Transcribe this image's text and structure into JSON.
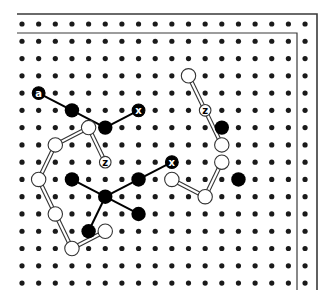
{
  "diagram": {
    "colors": {
      "background": "#ffffff",
      "dot": "#1a1a1a",
      "black_node": "#000000",
      "white_node_fill": "#ffffff",
      "outline": "#333333",
      "border": "#3a3a3a"
    },
    "grid": {
      "cols": 18,
      "rows": 16,
      "origin_x": 22,
      "origin_y": 24,
      "step_x": 16.65,
      "step_y": 17.27,
      "dot_radius": 2.6
    },
    "borders": {
      "outer": {
        "x1": 17,
        "y_top": 14,
        "x_right": 317,
        "y_bottom": 290
      },
      "inner": {
        "x1": 17,
        "y_top": 33,
        "x_right": 297,
        "y_bottom": 290
      }
    },
    "black_nodes": [
      {
        "c": 3,
        "r": 5
      },
      {
        "c": 5,
        "r": 6
      },
      {
        "c": 3,
        "r": 9
      },
      {
        "c": 5,
        "r": 10
      },
      {
        "c": 7,
        "r": 9
      },
      {
        "c": 7,
        "r": 11
      },
      {
        "c": 4,
        "r": 12
      },
      {
        "c": 12,
        "r": 6
      },
      {
        "c": 13,
        "r": 9
      }
    ],
    "white_nodes": [
      {
        "c": 4,
        "r": 6
      },
      {
        "c": 2,
        "r": 7
      },
      {
        "c": 1,
        "r": 9
      },
      {
        "c": 2,
        "r": 11
      },
      {
        "c": 3,
        "r": 13
      },
      {
        "c": 5,
        "r": 12
      },
      {
        "c": 10,
        "r": 3
      },
      {
        "c": 12,
        "r": 7
      },
      {
        "c": 12,
        "r": 8
      },
      {
        "c": 11,
        "r": 10
      },
      {
        "c": 9,
        "r": 9
      }
    ],
    "labeled_nodes": [
      {
        "c": 1,
        "r": 4,
        "label": "a",
        "style": "black"
      },
      {
        "c": 7,
        "r": 5,
        "label": "x",
        "style": "black"
      },
      {
        "c": 9,
        "r": 8,
        "label": "x",
        "style": "black"
      },
      {
        "c": 5,
        "r": 8,
        "label": "z",
        "style": "white"
      },
      {
        "c": 11,
        "r": 5,
        "label": "z",
        "style": "white"
      }
    ],
    "black_edges": [
      [
        [
          1,
          4
        ],
        [
          3,
          5
        ]
      ],
      [
        [
          3,
          5
        ],
        [
          5,
          6
        ]
      ],
      [
        [
          5,
          6
        ],
        [
          7,
          5
        ]
      ],
      [
        [
          3,
          9
        ],
        [
          5,
          10
        ]
      ],
      [
        [
          5,
          10
        ],
        [
          7,
          9
        ]
      ],
      [
        [
          7,
          9
        ],
        [
          9,
          8
        ]
      ],
      [
        [
          5,
          10
        ],
        [
          7,
          11
        ]
      ],
      [
        [
          5,
          10
        ],
        [
          4,
          12
        ]
      ]
    ],
    "double_edges": [
      [
        [
          5,
          8
        ],
        [
          4,
          6
        ]
      ],
      [
        [
          4,
          6
        ],
        [
          2,
          7
        ]
      ],
      [
        [
          2,
          7
        ],
        [
          1,
          9
        ]
      ],
      [
        [
          1,
          9
        ],
        [
          2,
          11
        ]
      ],
      [
        [
          2,
          11
        ],
        [
          3,
          13
        ]
      ],
      [
        [
          3,
          13
        ],
        [
          5,
          12
        ]
      ],
      [
        [
          10,
          3
        ],
        [
          11,
          5
        ]
      ],
      [
        [
          11,
          5
        ],
        [
          12,
          7
        ]
      ],
      [
        [
          12,
          8
        ],
        [
          11,
          10
        ]
      ],
      [
        [
          11,
          10
        ],
        [
          9,
          9
        ]
      ]
    ]
  }
}
